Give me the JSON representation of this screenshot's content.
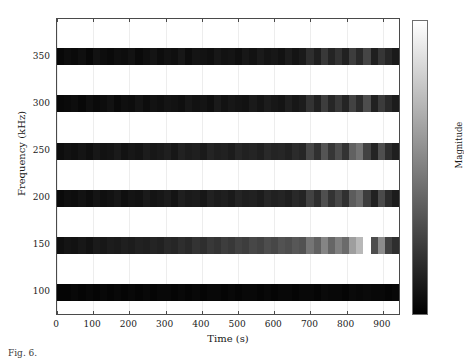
{
  "figure": {
    "type": "heatmap-spectrogram",
    "background_color": "#ffffff",
    "axis_color": "#4a4a4a",
    "gridline_color": "#ededed"
  },
  "axes": {
    "xlabel": "Time (s)",
    "ylabel": "Frequency (kHz)",
    "xticks": [
      "0",
      "100",
      "200",
      "300",
      "400",
      "500",
      "600",
      "700",
      "800",
      "900"
    ],
    "yticks": [
      "350",
      "300",
      "250",
      "200",
      "150",
      "100"
    ]
  },
  "colorbar": {
    "label": "Magnitude",
    "top_color": "#ffffff",
    "bottom_color": "#000000",
    "orientation": "vertical"
  },
  "caption": {
    "text": "Fig. 6."
  },
  "chart_data": {
    "type": "heatmap",
    "title": "",
    "xlabel": "Time (s)",
    "ylabel": "Frequency (kHz)",
    "xlim": [
      0,
      950
    ],
    "ylim": [
      75,
      390
    ],
    "xticks": [
      0,
      100,
      200,
      300,
      400,
      500,
      600,
      700,
      800,
      900
    ],
    "yticks": [
      100,
      150,
      200,
      250,
      300,
      350
    ],
    "grid": true,
    "colormap": "gray",
    "colorbar_label": "Magnitude",
    "colorbar_range": [
      0,
      1
    ],
    "legend": "none",
    "x": [
      10,
      30,
      50,
      70,
      90,
      110,
      130,
      150,
      170,
      190,
      210,
      230,
      250,
      270,
      290,
      310,
      330,
      350,
      370,
      390,
      410,
      430,
      450,
      470,
      490,
      510,
      530,
      550,
      570,
      590,
      610,
      630,
      650,
      670,
      690,
      710,
      730,
      750,
      770,
      790,
      810,
      830,
      850,
      870,
      890,
      910,
      930,
      950
    ],
    "rows": [
      {
        "frequency": 350,
        "values": [
          0.03,
          0.05,
          0.04,
          0.06,
          0.03,
          0.07,
          0.05,
          0.04,
          0.06,
          0.05,
          0.07,
          0.04,
          0.06,
          0.08,
          0.05,
          0.07,
          0.06,
          0.09,
          0.05,
          0.08,
          0.07,
          0.06,
          0.09,
          0.07,
          0.08,
          0.06,
          0.09,
          0.07,
          0.1,
          0.08,
          0.09,
          0.07,
          0.11,
          0.08,
          0.1,
          0.18,
          0.12,
          0.22,
          0.14,
          0.2,
          0.13,
          0.24,
          0.16,
          0.27,
          0.12,
          0.21,
          0.15,
          0.1
        ]
      },
      {
        "frequency": 300,
        "values": [
          0.03,
          0.04,
          0.05,
          0.03,
          0.06,
          0.04,
          0.05,
          0.07,
          0.04,
          0.06,
          0.05,
          0.08,
          0.05,
          0.07,
          0.06,
          0.08,
          0.07,
          0.06,
          0.09,
          0.07,
          0.08,
          0.06,
          0.1,
          0.07,
          0.09,
          0.08,
          0.07,
          0.1,
          0.08,
          0.11,
          0.09,
          0.08,
          0.12,
          0.09,
          0.11,
          0.2,
          0.13,
          0.24,
          0.15,
          0.22,
          0.14,
          0.26,
          0.17,
          0.3,
          0.13,
          0.23,
          0.16,
          0.11
        ]
      },
      {
        "frequency": 250,
        "values": [
          0.05,
          0.07,
          0.06,
          0.08,
          0.06,
          0.09,
          0.07,
          0.08,
          0.1,
          0.07,
          0.09,
          0.08,
          0.11,
          0.09,
          0.1,
          0.12,
          0.09,
          0.13,
          0.11,
          0.12,
          0.1,
          0.14,
          0.12,
          0.13,
          0.11,
          0.15,
          0.13,
          0.14,
          0.12,
          0.16,
          0.14,
          0.15,
          0.13,
          0.17,
          0.15,
          0.28,
          0.19,
          0.33,
          0.21,
          0.3,
          0.2,
          0.38,
          0.45,
          0.26,
          0.14,
          0.31,
          0.18,
          0.12
        ]
      },
      {
        "frequency": 200,
        "values": [
          0.04,
          0.06,
          0.05,
          0.07,
          0.05,
          0.08,
          0.06,
          0.07,
          0.09,
          0.06,
          0.08,
          0.07,
          0.1,
          0.08,
          0.09,
          0.11,
          0.08,
          0.12,
          0.1,
          0.11,
          0.09,
          0.13,
          0.11,
          0.12,
          0.1,
          0.14,
          0.12,
          0.13,
          0.11,
          0.15,
          0.13,
          0.14,
          0.12,
          0.16,
          0.14,
          0.26,
          0.18,
          0.31,
          0.2,
          0.28,
          0.19,
          0.36,
          0.42,
          0.24,
          0.13,
          0.29,
          0.17,
          0.11
        ]
      },
      {
        "frequency": 150,
        "values": [
          0.06,
          0.08,
          0.07,
          0.09,
          0.07,
          0.1,
          0.09,
          0.11,
          0.1,
          0.12,
          0.11,
          0.13,
          0.12,
          0.14,
          0.13,
          0.16,
          0.15,
          0.18,
          0.16,
          0.2,
          0.18,
          0.22,
          0.2,
          0.24,
          0.22,
          0.26,
          0.24,
          0.28,
          0.26,
          0.3,
          0.28,
          0.32,
          0.3,
          0.34,
          0.32,
          0.46,
          0.38,
          0.52,
          0.4,
          0.5,
          0.42,
          0.62,
          0.72,
          1.0,
          0.3,
          0.55,
          0.26,
          0.18
        ]
      },
      {
        "frequency": 100,
        "values": [
          0.02,
          0.02,
          0.03,
          0.02,
          0.03,
          0.02,
          0.03,
          0.02,
          0.03,
          0.02,
          0.03,
          0.02,
          0.03,
          0.02,
          0.03,
          0.03,
          0.02,
          0.03,
          0.02,
          0.03,
          0.02,
          0.03,
          0.03,
          0.02,
          0.03,
          0.02,
          0.03,
          0.03,
          0.02,
          0.03,
          0.02,
          0.03,
          0.03,
          0.02,
          0.03,
          0.03,
          0.02,
          0.04,
          0.03,
          0.03,
          0.02,
          0.04,
          0.03,
          0.04,
          0.03,
          0.03,
          0.02,
          0.03
        ]
      }
    ]
  }
}
